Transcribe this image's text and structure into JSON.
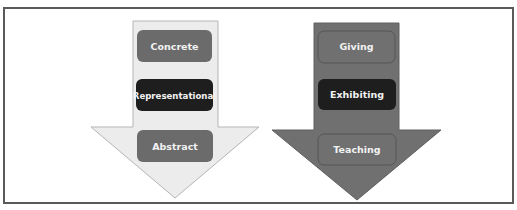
{
  "diagram": {
    "left_arrow": {
      "direction": "down",
      "fill_color": "#ececec",
      "stroke_color": "#b5b5b5",
      "steps": [
        {
          "label": "Concrete",
          "fill": "#6b6b6b"
        },
        {
          "label": "Representational",
          "fill": "#1e1e1e"
        },
        {
          "label": "Abstract",
          "fill": "#6b6b6b"
        }
      ]
    },
    "right_arrow": {
      "direction": "down",
      "fill_color": "#707070",
      "stroke_color": "#555555",
      "steps": [
        {
          "label": "Giving",
          "fill": "#707070"
        },
        {
          "label": "Exhibiting",
          "fill": "#1e1e1e"
        },
        {
          "label": "Teaching",
          "fill": "#707070"
        }
      ]
    },
    "frame_border_color": "#5a5a5a"
  }
}
